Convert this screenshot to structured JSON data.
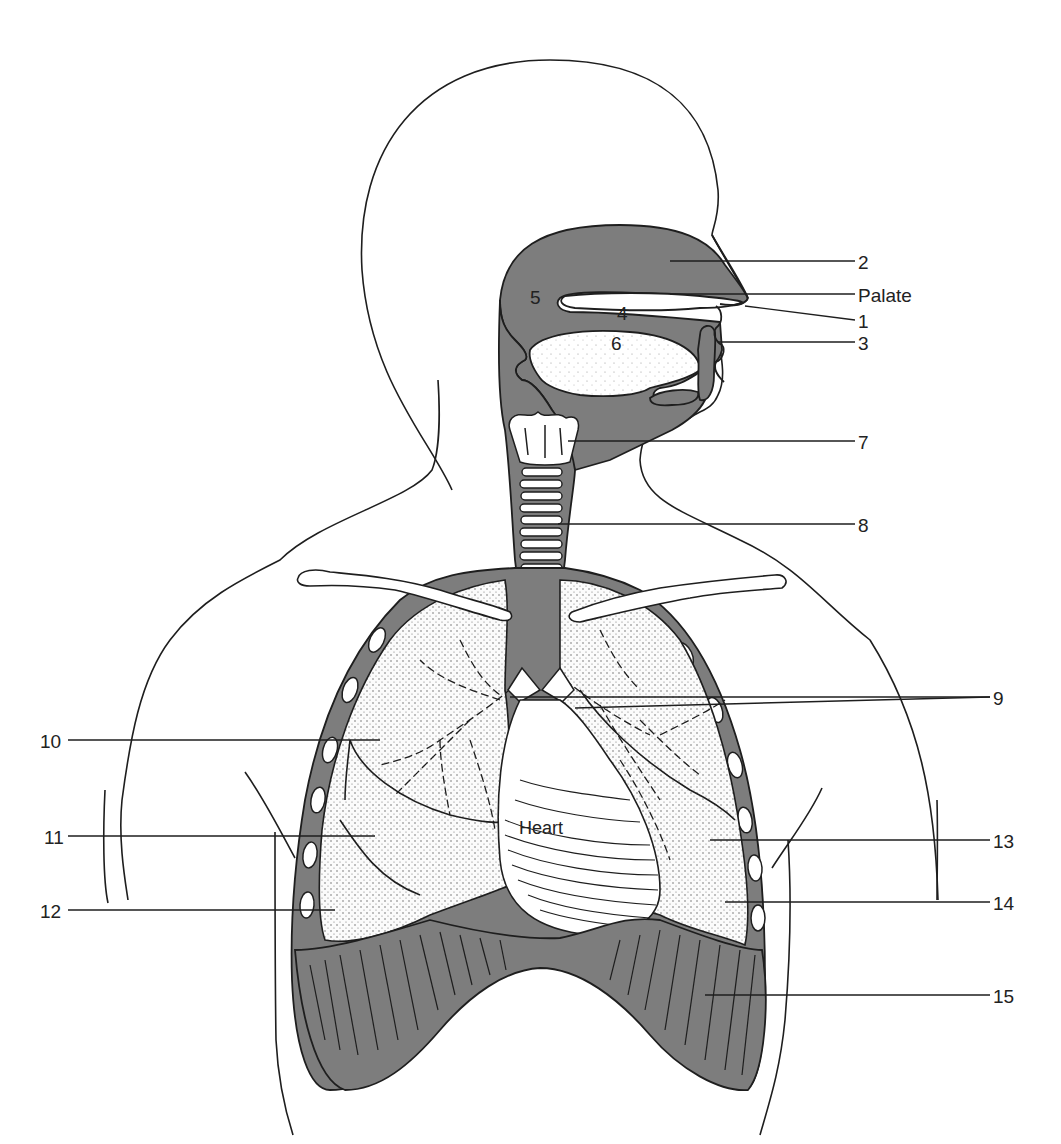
{
  "figure": {
    "caption_partial": "g   y",
    "colors": {
      "ink": "#1e1e1e",
      "shade": "#7d7d7d",
      "lung": "#f4f4f4",
      "paper": "#ffffff"
    },
    "inline_labels": {
      "l4": "4",
      "l5": "5",
      "l6": "6",
      "heart": "Heart"
    },
    "callouts": [
      {
        "id": "2",
        "text": "2"
      },
      {
        "id": "palate",
        "text": "Palate"
      },
      {
        "id": "1",
        "text": "1"
      },
      {
        "id": "3",
        "text": "3"
      },
      {
        "id": "7",
        "text": "7"
      },
      {
        "id": "8",
        "text": "8"
      },
      {
        "id": "9",
        "text": "9"
      },
      {
        "id": "10",
        "text": "10"
      },
      {
        "id": "11",
        "text": "11"
      },
      {
        "id": "12",
        "text": "12"
      },
      {
        "id": "13",
        "text": "13"
      },
      {
        "id": "14",
        "text": "14"
      },
      {
        "id": "15",
        "text": "15"
      }
    ]
  }
}
